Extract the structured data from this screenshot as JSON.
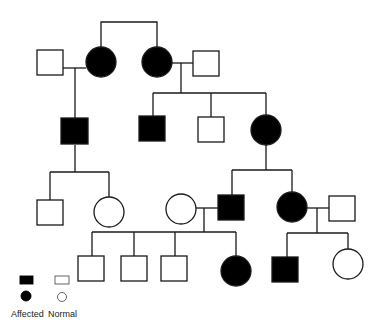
{
  "diagram": {
    "type": "pedigree",
    "colors": {
      "affected": "#000000",
      "normal_fill": "#ffffff",
      "line": "#1a1a1a",
      "background": "#ffffff"
    },
    "individuals": [
      {
        "id": "I-1",
        "sex": "male",
        "affected": false,
        "shape": "square",
        "x": 37,
        "y": 50,
        "size": 26
      },
      {
        "id": "I-2",
        "sex": "female",
        "affected": true,
        "shape": "circle",
        "cx": 101,
        "cy": 62,
        "r": 15
      },
      {
        "id": "I-3",
        "sex": "female",
        "affected": true,
        "shape": "circle",
        "cx": 157,
        "cy": 62,
        "r": 15
      },
      {
        "id": "I-4",
        "sex": "male",
        "affected": false,
        "shape": "square",
        "x": 193,
        "y": 51,
        "size": 26
      },
      {
        "id": "II-1",
        "sex": "male",
        "affected": true,
        "shape": "square",
        "x": 61,
        "y": 118,
        "size": 27
      },
      {
        "id": "II-2",
        "sex": "male",
        "affected": true,
        "shape": "square",
        "x": 139,
        "y": 116,
        "size": 26
      },
      {
        "id": "II-3",
        "sex": "male",
        "affected": false,
        "shape": "square",
        "x": 198,
        "y": 117,
        "size": 26
      },
      {
        "id": "II-4",
        "sex": "female",
        "affected": true,
        "shape": "circle",
        "cx": 266,
        "cy": 130,
        "r": 15
      },
      {
        "id": "III-1",
        "sex": "male",
        "affected": false,
        "shape": "square",
        "x": 37,
        "y": 200,
        "size": 26
      },
      {
        "id": "III-2",
        "sex": "female",
        "affected": false,
        "shape": "circle",
        "cx": 109,
        "cy": 212,
        "r": 15
      },
      {
        "id": "III-3",
        "sex": "female",
        "affected": false,
        "shape": "circle",
        "cx": 181,
        "cy": 209,
        "r": 15
      },
      {
        "id": "III-4",
        "sex": "male",
        "affected": true,
        "shape": "square",
        "x": 218,
        "y": 195,
        "size": 26
      },
      {
        "id": "III-5",
        "sex": "female",
        "affected": true,
        "shape": "circle",
        "cx": 292,
        "cy": 207,
        "r": 15
      },
      {
        "id": "III-6",
        "sex": "male",
        "affected": false,
        "shape": "square",
        "x": 329,
        "y": 196,
        "size": 26
      },
      {
        "id": "IV-1",
        "sex": "male",
        "affected": false,
        "shape": "square",
        "x": 78,
        "y": 256,
        "size": 26
      },
      {
        "id": "IV-2",
        "sex": "male",
        "affected": false,
        "shape": "square",
        "x": 121,
        "y": 256,
        "size": 26
      },
      {
        "id": "IV-3",
        "sex": "male",
        "affected": false,
        "shape": "square",
        "x": 161,
        "y": 256,
        "size": 26
      },
      {
        "id": "IV-4",
        "sex": "female",
        "affected": true,
        "shape": "circle",
        "cx": 236,
        "cy": 271,
        "r": 15
      },
      {
        "id": "IV-5",
        "sex": "male",
        "affected": true,
        "shape": "square",
        "x": 272,
        "y": 257,
        "size": 26
      },
      {
        "id": "IV-6",
        "sex": "female",
        "affected": false,
        "shape": "circle",
        "cx": 348,
        "cy": 264,
        "r": 15
      }
    ],
    "lines": [
      {
        "name": "sibling-line-I2-I3",
        "points": [
          [
            101,
            47
          ],
          [
            101,
            22
          ],
          [
            157,
            22
          ],
          [
            157,
            47
          ]
        ]
      },
      {
        "name": "marriage-line-I1-I2",
        "points": [
          [
            63,
            68
          ],
          [
            86,
            68
          ]
        ]
      },
      {
        "name": "descent-line-II1",
        "points": [
          [
            75,
            68
          ],
          [
            75,
            118
          ]
        ]
      },
      {
        "name": "marriage-line-I3-I4",
        "points": [
          [
            172,
            63
          ],
          [
            193,
            63
          ]
        ]
      },
      {
        "name": "descent-line-I3-I4",
        "points": [
          [
            181,
            63
          ],
          [
            181,
            93
          ]
        ]
      },
      {
        "name": "sibship-line-II",
        "points": [
          [
            153,
            93
          ],
          [
            266,
            93
          ]
        ]
      },
      {
        "name": "drop-II2",
        "points": [
          [
            153,
            93
          ],
          [
            153,
            116
          ]
        ]
      },
      {
        "name": "drop-II3",
        "points": [
          [
            211,
            93
          ],
          [
            211,
            117
          ]
        ]
      },
      {
        "name": "drop-II4",
        "points": [
          [
            266,
            93
          ],
          [
            266,
            115
          ]
        ]
      },
      {
        "name": "descent-line-II1-children",
        "points": [
          [
            75,
            145
          ],
          [
            75,
            172
          ]
        ]
      },
      {
        "name": "sibship-line-III-left",
        "points": [
          [
            50,
            172
          ],
          [
            109,
            172
          ]
        ]
      },
      {
        "name": "drop-III1",
        "points": [
          [
            50,
            172
          ],
          [
            50,
            200
          ]
        ]
      },
      {
        "name": "drop-III2",
        "points": [
          [
            109,
            172
          ],
          [
            109,
            197
          ]
        ]
      },
      {
        "name": "descent-line-II4-children",
        "points": [
          [
            266,
            145
          ],
          [
            266,
            170
          ]
        ]
      },
      {
        "name": "sibship-line-III-right",
        "points": [
          [
            232,
            170
          ],
          [
            292,
            170
          ]
        ]
      },
      {
        "name": "drop-III4",
        "points": [
          [
            232,
            170
          ],
          [
            232,
            195
          ]
        ]
      },
      {
        "name": "drop-III5",
        "points": [
          [
            292,
            170
          ],
          [
            292,
            192
          ]
        ]
      },
      {
        "name": "marriage-line-III3-III4",
        "points": [
          [
            196,
            208
          ],
          [
            218,
            208
          ]
        ]
      },
      {
        "name": "descent-line-III3-III4",
        "points": [
          [
            204,
            208
          ],
          [
            204,
            232
          ]
        ]
      },
      {
        "name": "sibship-line-IV-left",
        "points": [
          [
            92,
            232
          ],
          [
            236,
            232
          ]
        ]
      },
      {
        "name": "drop-IV1",
        "points": [
          [
            92,
            232
          ],
          [
            92,
            256
          ]
        ]
      },
      {
        "name": "drop-IV2",
        "points": [
          [
            134,
            232
          ],
          [
            134,
            256
          ]
        ]
      },
      {
        "name": "drop-IV3",
        "points": [
          [
            175,
            232
          ],
          [
            175,
            256
          ]
        ]
      },
      {
        "name": "drop-IV4",
        "points": [
          [
            236,
            232
          ],
          [
            236,
            256
          ]
        ]
      },
      {
        "name": "marriage-line-III5-III6",
        "points": [
          [
            307,
            208
          ],
          [
            329,
            208
          ]
        ]
      },
      {
        "name": "descent-line-III5-III6",
        "points": [
          [
            317,
            208
          ],
          [
            317,
            233
          ]
        ]
      },
      {
        "name": "sibship-line-IV-right",
        "points": [
          [
            287,
            233
          ],
          [
            348,
            233
          ]
        ]
      },
      {
        "name": "drop-IV5",
        "points": [
          [
            287,
            233
          ],
          [
            287,
            257
          ]
        ]
      },
      {
        "name": "drop-IV6",
        "points": [
          [
            348,
            233
          ],
          [
            348,
            249
          ]
        ]
      }
    ]
  },
  "legend": {
    "symbols": [
      {
        "name": "legend-affected-male",
        "shape": "rect",
        "x": 20,
        "y": 276,
        "w": 13,
        "h": 8,
        "affected": true
      },
      {
        "name": "legend-normal-male",
        "shape": "rect",
        "x": 55,
        "y": 276,
        "w": 14,
        "h": 8,
        "affected": false
      },
      {
        "name": "legend-affected-female",
        "shape": "circle",
        "cx": 26,
        "cy": 296,
        "r": 5,
        "affected": true
      },
      {
        "name": "legend-normal-female",
        "shape": "circle",
        "cx": 62,
        "cy": 297,
        "r": 4.5,
        "affected": false
      }
    ],
    "labels": {
      "affected": "Affected",
      "normal": "Normal"
    }
  }
}
